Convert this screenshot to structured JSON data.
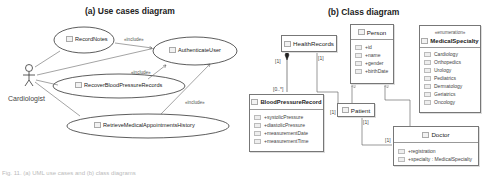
{
  "use_case_diagram": {
    "title": "(a) Use cases diagram",
    "actor": "Cardiologist",
    "use_cases": [
      {
        "name": "RecordNotes"
      },
      {
        "name": "AuthenticateUser"
      },
      {
        "name": "RecoverBloodPressureRecords"
      },
      {
        "name": "RetrieveMedicalAppointmentsHistory"
      }
    ],
    "include_labels": [
      "«include»",
      "«include»",
      "«include»"
    ]
  },
  "class_diagram": {
    "title": "(b) Class diagram",
    "classes": {
      "health_records": {
        "name": "HealthRecords"
      },
      "person": {
        "name": "Person",
        "attributes": [
          "+id",
          "+name",
          "+gender",
          "+birthDate"
        ]
      },
      "medical_specialty": {
        "stereotype": "«enumeration»",
        "name": "MedicalSpecialty",
        "literals": [
          "Cardiology",
          "Orthopedics",
          "Urology",
          "Pediatrics",
          "Dermatology",
          "Geriatrics",
          "Oncology"
        ]
      },
      "blood_pressure_record": {
        "name": "BloodPressureRecord",
        "attributes": [
          "+systolicPressure",
          "+diastolicPressure",
          "+measurementDate",
          "+measurementTime"
        ]
      },
      "patient": {
        "name": "Patient"
      },
      "doctor": {
        "name": "Doctor",
        "attributes": [
          "+registration",
          "+specialty : MedicalSpecialty"
        ]
      }
    },
    "multiplicities": {
      "hr_bpr_top": "[1]",
      "hr_bpr_bottom": "[0..*]",
      "hr_patient_top": "[1]",
      "hr_patient_bottom": "[1]",
      "patient_doctor_top": "[1]",
      "patient_doctor_bottom": "[1]"
    }
  },
  "caption": "Fig. 11. (a) UML use cases and (b) class diagrams"
}
